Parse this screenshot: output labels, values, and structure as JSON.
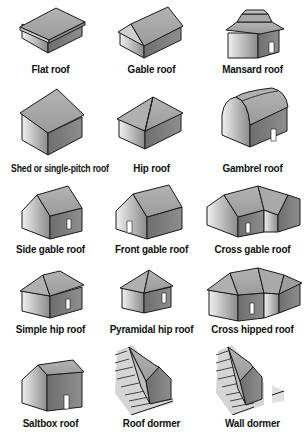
{
  "diagram": {
    "title": "",
    "colors": {
      "roof": "#a6a6a6",
      "wall_light": "#d9d9d9",
      "wall_dark": "#7a7a7a",
      "outline": "#1a1a1a",
      "door": "#ffffff"
    },
    "items": [
      {
        "id": "flat",
        "label": "Flat roof",
        "icon": "flat-roof-icon"
      },
      {
        "id": "gable",
        "label": "Gable roof",
        "icon": "gable-roof-icon"
      },
      {
        "id": "mansard",
        "label": "Mansard roof",
        "icon": "mansard-roof-icon"
      },
      {
        "id": "shed",
        "label": "Shed or single-pitch roof",
        "icon": "shed-roof-icon"
      },
      {
        "id": "hip",
        "label": "Hip roof",
        "icon": "hip-roof-icon"
      },
      {
        "id": "gambrel",
        "label": "Gambrel roof",
        "icon": "gambrel-roof-icon"
      },
      {
        "id": "side-gable",
        "label": "Side gable roof",
        "icon": "side-gable-roof-icon"
      },
      {
        "id": "front-gable",
        "label": "Front gable roof",
        "icon": "front-gable-roof-icon"
      },
      {
        "id": "cross-gable",
        "label": "Cross gable roof",
        "icon": "cross-gable-roof-icon"
      },
      {
        "id": "simple-hip",
        "label": "Simple hip roof",
        "icon": "simple-hip-roof-icon"
      },
      {
        "id": "pyramidal-hip",
        "label": "Pyramidal hip roof",
        "icon": "pyramidal-hip-roof-icon"
      },
      {
        "id": "cross-hipped",
        "label": "Cross hipped roof",
        "icon": "cross-hipped-roof-icon"
      },
      {
        "id": "saltbox",
        "label": "Saltbox roof",
        "icon": "saltbox-roof-icon"
      },
      {
        "id": "roof-dormer",
        "label": "Roof dormer",
        "icon": "roof-dormer-icon"
      },
      {
        "id": "wall-dormer",
        "label": "Wall dormer",
        "icon": "wall-dormer-icon"
      }
    ]
  }
}
